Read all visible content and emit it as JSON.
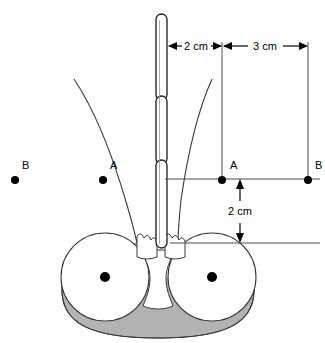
{
  "figure": {
    "type": "technical-measurement-diagram",
    "background_color": "#ffffff",
    "stroke_color": "#000000",
    "outline_color": "#3a3a3a",
    "shade_color": "#b3b3b3",
    "width": 325,
    "height": 343
  },
  "dimensions": [
    {
      "id": "dim-horizontal-2cm",
      "label": "2 cm",
      "orientation": "horizontal",
      "value": 2,
      "unit": "cm",
      "label_x": 196,
      "label_y": 50,
      "line_y": 46,
      "x_start": 168,
      "x_end": 222
    },
    {
      "id": "dim-horizontal-3cm",
      "label": "3 cm",
      "orientation": "horizontal",
      "value": 3,
      "unit": "cm",
      "label_x": 265,
      "label_y": 50,
      "line_y": 46,
      "x_start": 222,
      "x_end": 308
    },
    {
      "id": "dim-vertical-2cm",
      "label": "2 cm",
      "orientation": "vertical",
      "value": 2,
      "unit": "cm",
      "label_x": 240,
      "label_y": 215,
      "line_x": 240,
      "y_start": 179,
      "y_end": 243
    }
  ],
  "points": [
    {
      "id": "point-b-left",
      "label": "B",
      "cx": 15,
      "cy": 180,
      "label_x": 22,
      "label_y": 169,
      "r": 4
    },
    {
      "id": "point-a-left",
      "label": "A",
      "cx": 103,
      "cy": 180,
      "label_x": 110,
      "label_y": 169,
      "r": 4
    },
    {
      "id": "point-a-right",
      "label": "A",
      "cx": 222,
      "cy": 180,
      "label_x": 230,
      "label_y": 169,
      "r": 4
    },
    {
      "id": "point-b-right",
      "label": "B",
      "cx": 308,
      "cy": 180,
      "label_x": 315,
      "label_y": 169,
      "r": 4
    }
  ],
  "centers": [
    {
      "id": "circle-center-left",
      "cx": 105,
      "cy": 277,
      "r": 5
    },
    {
      "id": "circle-center-right",
      "cx": 212,
      "cy": 277,
      "r": 5
    }
  ],
  "reference_lines": [
    {
      "id": "ref-line-upper",
      "orientation": "horizontal",
      "x1": 165,
      "x2": 320,
      "y": 179
    },
    {
      "id": "ref-line-lower",
      "orientation": "horizontal",
      "x1": 170,
      "x2": 320,
      "y": 243
    },
    {
      "id": "ext-line-left",
      "orientation": "vertical",
      "x": 222,
      "y1": 46,
      "y2": 180
    },
    {
      "id": "ext-line-right",
      "orientation": "vertical",
      "x": 308,
      "y1": 46,
      "y2": 180
    }
  ]
}
